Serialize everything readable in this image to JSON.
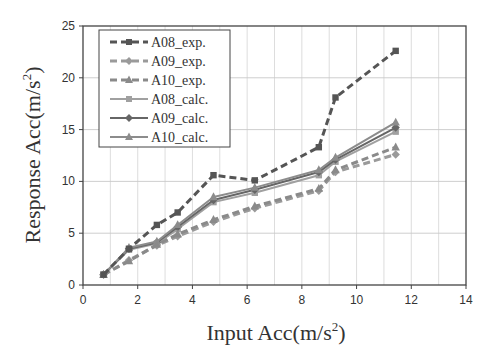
{
  "chart_data": {
    "type": "line",
    "title": "",
    "xlabel": "Input Acc(m/s²)",
    "ylabel": "Response Acc(m/s²)",
    "xlim": [
      0,
      14
    ],
    "ylim": [
      0,
      25
    ],
    "x_ticks": [
      0,
      2,
      4,
      6,
      8,
      10,
      12,
      14
    ],
    "y_ticks": [
      0,
      5,
      10,
      15,
      20,
      25
    ],
    "grid": true,
    "legend_position": "upper left",
    "x": [
      0.75,
      1.68,
      2.7,
      3.46,
      4.77,
      6.28,
      8.62,
      9.23,
      11.43
    ],
    "series": [
      {
        "name": "A08_exp.",
        "style": "dashed",
        "marker": "square",
        "color": "#555555",
        "values": [
          1.0,
          3.5,
          5.8,
          7.0,
          10.6,
          10.1,
          13.3,
          18.1,
          22.6
        ]
      },
      {
        "name": "A09_exp.",
        "style": "dashed",
        "marker": "diamond",
        "color": "#9a9a9a",
        "values": [
          1.0,
          2.4,
          3.8,
          4.7,
          6.1,
          7.4,
          9.1,
          10.9,
          12.6
        ]
      },
      {
        "name": "A10_exp.",
        "style": "dashed",
        "marker": "triangle",
        "color": "#8a8a8a",
        "values": [
          1.0,
          2.3,
          3.9,
          4.9,
          6.3,
          7.6,
          9.3,
          11.1,
          13.3
        ]
      },
      {
        "name": "A08_calc.",
        "style": "solid",
        "marker": "square",
        "color": "#a0a0a0",
        "values": [
          1.0,
          3.4,
          4.0,
          5.4,
          8.0,
          8.9,
          10.6,
          11.9,
          14.8
        ]
      },
      {
        "name": "A09_calc.",
        "style": "solid",
        "marker": "diamond",
        "color": "#666666",
        "values": [
          1.0,
          3.5,
          4.1,
          5.6,
          8.2,
          9.2,
          10.9,
          12.1,
          15.2
        ]
      },
      {
        "name": "A10_calc.",
        "style": "solid",
        "marker": "triangle",
        "color": "#8c8c8c",
        "values": [
          1.0,
          3.6,
          4.2,
          5.8,
          8.5,
          9.4,
          11.1,
          12.3,
          15.7
        ]
      }
    ]
  },
  "axes": {
    "xlabel_main": "Input Acc(m/s",
    "xlabel_sup": "2",
    "xlabel_end": ")",
    "ylabel_main": "Response Acc(m/s",
    "ylabel_sup": "2",
    "ylabel_end": ")"
  }
}
